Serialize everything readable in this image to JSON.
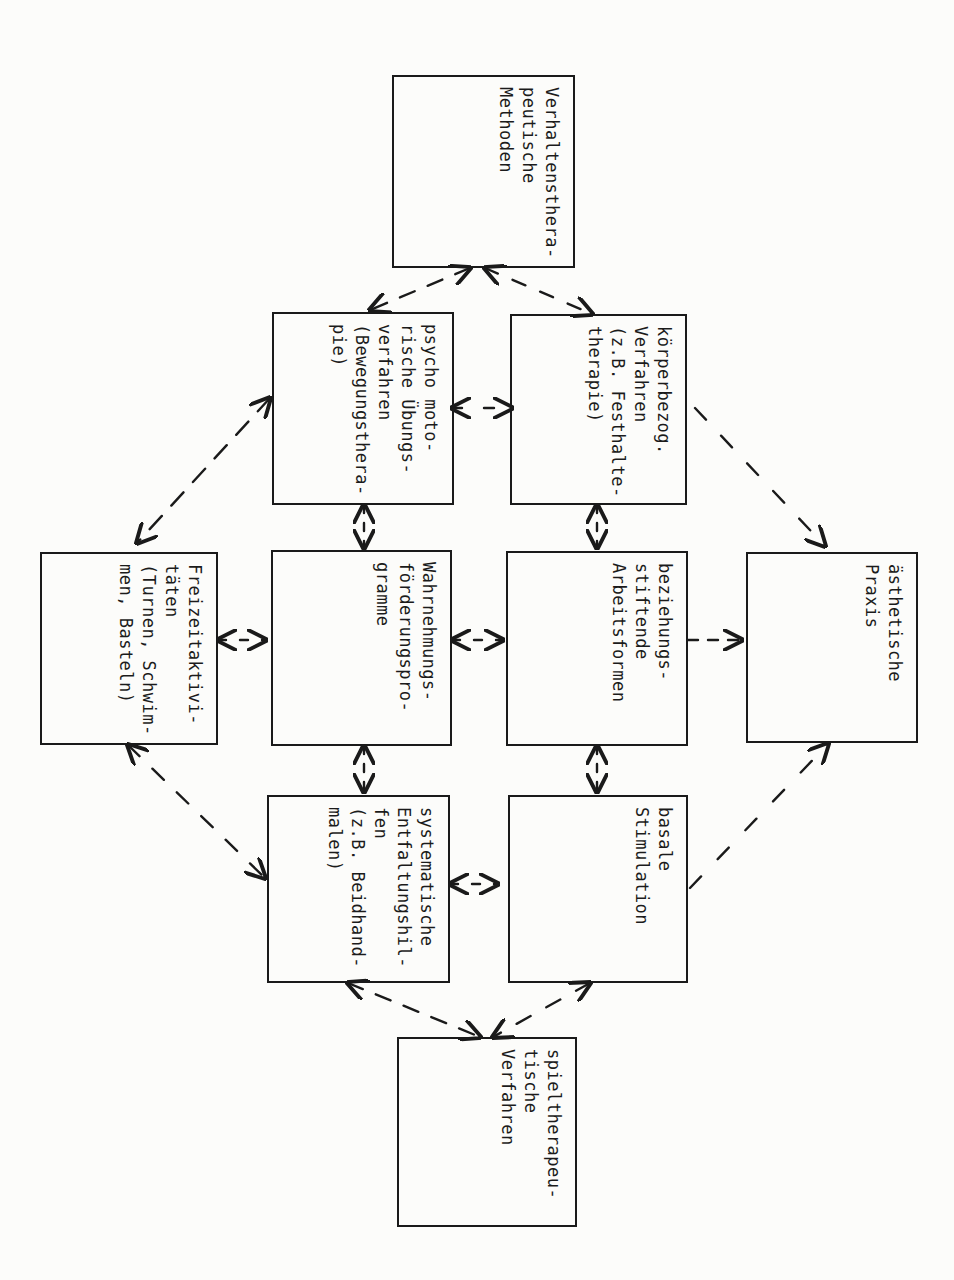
{
  "diagram": {
    "orientation": "rotated 90deg clockwise (text reads top-to-bottom)",
    "nodes": [
      {
        "id": "verhaltenstherapeutische",
        "lines": "Verhaltensthera-\npeutische\nMethoden"
      },
      {
        "id": "psychomotorische",
        "lines": "psycho moto-\nrische Übungs-\nverfahren\n(Bewegungsthera-\npie)"
      },
      {
        "id": "koerperbezogene",
        "lines": "körperbezog.\nVerfahren\n(z.B. Festhalte-\ntherapie)"
      },
      {
        "id": "freizeitaktivitaeten",
        "lines": "Freizeitaktivi-\ntäten\n(Turnen, Schwim-\nmen, Basteln)"
      },
      {
        "id": "wahrnehmungsfoerderung",
        "lines": "Wahrnehmungs-\nförderungspro-\ngramme"
      },
      {
        "id": "beziehungsstiftende",
        "lines": "beziehungs-\nstiftende\nArbeitsformen"
      },
      {
        "id": "aesthetische",
        "lines": "ästhetische\nPraxis"
      },
      {
        "id": "systematische",
        "lines": "systematische\nEntfaltungshil-\nfen\n(z.B. Beidhand-\nmalen)"
      },
      {
        "id": "basale",
        "lines": "basale\nStimulation"
      },
      {
        "id": "spieltherapeutische",
        "lines": "spieltherapeu-\ntische\nVerfahren"
      }
    ],
    "edges": [
      {
        "from": "verhaltenstherapeutische",
        "to": "psychomotorische",
        "style": "dashed",
        "arrows": "both"
      },
      {
        "from": "verhaltenstherapeutische",
        "to": "koerperbezogene",
        "style": "dashed",
        "arrows": "both"
      },
      {
        "from": "psychomotorische",
        "to": "koerperbezogene",
        "style": "dashed",
        "arrows": "both"
      },
      {
        "from": "psychomotorische",
        "to": "freizeitaktivitaeten",
        "style": "dashed",
        "arrows": "both"
      },
      {
        "from": "psychomotorische",
        "to": "wahrnehmungsfoerderung",
        "style": "short",
        "arrows": "both"
      },
      {
        "from": "koerperbezogene",
        "to": "beziehungsstiftende",
        "style": "short",
        "arrows": "both"
      },
      {
        "from": "koerperbezogene",
        "to": "aesthetische",
        "style": "dashed",
        "arrows": "end"
      },
      {
        "from": "freizeitaktivitaeten",
        "to": "wahrnehmungsfoerderung",
        "style": "short",
        "arrows": "both"
      },
      {
        "from": "wahrnehmungsfoerderung",
        "to": "beziehungsstiftende",
        "style": "short",
        "arrows": "both"
      },
      {
        "from": "beziehungsstiftende",
        "to": "aesthetische",
        "style": "dashed",
        "arrows": "end"
      },
      {
        "from": "wahrnehmungsfoerderung",
        "to": "systematische",
        "style": "short",
        "arrows": "both"
      },
      {
        "from": "beziehungsstiftende",
        "to": "basale",
        "style": "short",
        "arrows": "both"
      },
      {
        "from": "freizeitaktivitaeten",
        "to": "systematische",
        "style": "dashed",
        "arrows": "both"
      },
      {
        "from": "systematische",
        "to": "basale",
        "style": "short",
        "arrows": "both"
      },
      {
        "from": "basale",
        "to": "aesthetische",
        "style": "dashed",
        "arrows": "end"
      },
      {
        "from": "systematische",
        "to": "spieltherapeutische",
        "style": "dashed",
        "arrows": "both"
      },
      {
        "from": "basale",
        "to": "spieltherapeutische",
        "style": "dashed",
        "arrows": "both"
      }
    ]
  }
}
